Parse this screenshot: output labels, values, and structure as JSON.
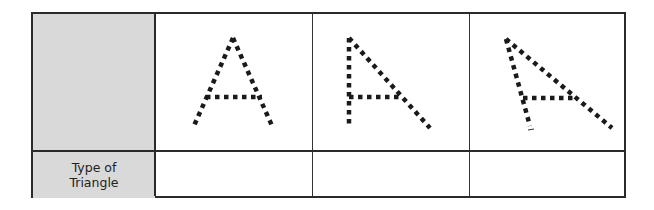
{
  "table": {
    "row_header_label": "Type of Triangle",
    "row_header_lines": [
      "Type of",
      "Triangle"
    ],
    "answer_cells": [
      "",
      "",
      ""
    ]
  },
  "figures": [
    {
      "name": "triangle-A-isosceles-shape",
      "apex": [
        233,
        38
      ],
      "left_base": [
        193,
        128
      ],
      "right_base": [
        273,
        128
      ],
      "crossbar": [
        [
          206,
          97
        ],
        [
          260,
          97
        ]
      ]
    },
    {
      "name": "triangle-A-right-shape",
      "apex": [
        349,
        38
      ],
      "left_base": [
        349,
        125
      ],
      "right_base": [
        430,
        128
      ],
      "crossbar": [
        [
          349,
          97
        ],
        [
          400,
          97
        ]
      ]
    },
    {
      "name": "triangle-A-obtuse-shape",
      "apex": [
        506,
        39
      ],
      "left_base": [
        530,
        127
      ],
      "right_base": [
        612,
        127
      ],
      "crossbar": [
        [
          523,
          98
        ],
        [
          571,
          98
        ]
      ]
    }
  ],
  "colors": {
    "header_fill": "#d9d9d9",
    "border": "#2a2a2a",
    "dots": "#1a1a1a"
  }
}
